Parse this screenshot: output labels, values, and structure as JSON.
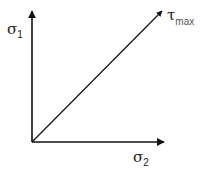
{
  "diagram": {
    "labels": {
      "y_axis": {
        "symbol": "σ",
        "subscript": "1"
      },
      "x_axis": {
        "symbol": "σ",
        "subscript": "2"
      },
      "diagonal": {
        "symbol": "τ",
        "subscript": "max"
      }
    },
    "colors": {
      "line": "#111111",
      "background": "#ffffff"
    }
  }
}
